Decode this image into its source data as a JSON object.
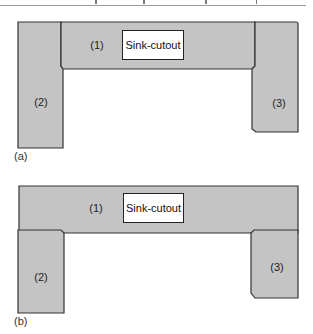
{
  "colors": {
    "fill": "#c4c4c4",
    "stroke": "#333333",
    "cutout_fill": "#ffffff"
  },
  "diagrams": [
    {
      "caption": "(a)",
      "description": "U-shaped countertop: back piece (1) between two full-depth side pieces (2) and (3)",
      "pieces": [
        {
          "id": "1",
          "label": "(1)"
        },
        {
          "id": "2",
          "label": "(2)"
        },
        {
          "id": "3",
          "label": "(3)"
        }
      ],
      "cutout": {
        "label": "Sink-cutout"
      }
    },
    {
      "caption": "(b)",
      "description": "U-shaped countertop: full-length back piece (1) with side pieces (2) and (3) below it",
      "pieces": [
        {
          "id": "1",
          "label": "(1)"
        },
        {
          "id": "2",
          "label": "(2)"
        },
        {
          "id": "3",
          "label": "(3)"
        }
      ],
      "cutout": {
        "label": "Sink-cutout"
      }
    }
  ]
}
